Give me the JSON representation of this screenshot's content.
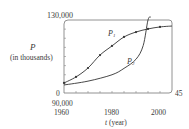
{
  "chart_data": {
    "type": "line",
    "title": "",
    "xlabel": "t (year)",
    "ylabel": "P (in thousands)",
    "x_variable": "t",
    "y_variable": "P",
    "y_unit": "(in thousands)",
    "x_unit": "(year)",
    "xlim": [
      1960,
      2005
    ],
    "ylim": [
      90000,
      130000
    ],
    "x_ticks": [
      "1960",
      "1980",
      "2000"
    ],
    "y_tick_top": "130,000",
    "y_tick_bottom": "90,000",
    "corner_labels": {
      "x_origin": "0",
      "x_end": "45"
    },
    "grid": false,
    "legend": "none (curves labeled inline)",
    "series": [
      {
        "name": "P1",
        "label": "P",
        "subscript": "1",
        "kind": "logistic model with data points",
        "x": [
          1960,
          1965,
          1970,
          1975,
          1980,
          1985,
          1990,
          1995,
          2000,
          2005
        ],
        "values": [
          95500,
          98800,
          103700,
          110800,
          115800,
          120700,
          123400,
          125100,
          126200,
          126700
        ],
        "markers_x": [
          1960,
          1965,
          1970,
          1975,
          1980,
          1985,
          1990,
          1995,
          2000
        ],
        "markers_y": [
          95500,
          98800,
          103700,
          110800,
          115800,
          120700,
          123400,
          125100,
          126200
        ]
      },
      {
        "name": "P2",
        "label": "P",
        "subscript": "2",
        "kind": "exponential model",
        "x": [
          1960,
          1970,
          1980,
          1985,
          1990,
          1993,
          1995
        ],
        "values": [
          94400,
          96500,
          100000,
          103500,
          108500,
          116000,
          130000
        ]
      }
    ]
  },
  "labels": {
    "y_top": "130,000",
    "y_var": "P",
    "y_unit": "(in thousands)",
    "x_zero": "0",
    "y_bottom": "90,000",
    "x_1960": "1960",
    "x_1980": "1980",
    "x_2000": "2000",
    "x_end": "45",
    "x_var": "t",
    "x_unit": "(year)",
    "p1_main": "P",
    "p1_sub": "1",
    "p2_main": "P",
    "p2_sub": "2"
  },
  "colors": {
    "axis": "#555555",
    "curve": "#333333",
    "text": "#3a3a3a"
  }
}
